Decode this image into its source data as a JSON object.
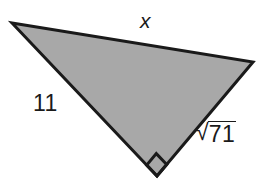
{
  "figure": {
    "kind": "right-triangle-diagram",
    "background_color": "#ffffff",
    "fill_color": "#a8a8a8",
    "stroke_color": "#1a1a1a",
    "stroke_width": 3,
    "canvas": {
      "width": 273,
      "height": 182
    },
    "vertices": {
      "top_left": {
        "x": 12,
        "y": 23
      },
      "right": {
        "x": 253,
        "y": 62
      },
      "bottom": {
        "x": 157,
        "y": 176
      }
    },
    "right_angle": {
      "at_vertex": "bottom",
      "marker": "square",
      "marker_size": 15
    },
    "labels": {
      "top_side": "x",
      "left_side": "11",
      "right_side_radical": "√",
      "right_side_radicand": "71"
    }
  }
}
